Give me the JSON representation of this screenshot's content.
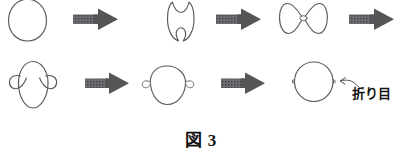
{
  "figure": {
    "caption_label": "図",
    "caption_number": "3",
    "annotation_label": "折り目",
    "annotation_meaning_icon": "pointer-arrow-icon",
    "stroke_color": "#5a5a5e",
    "arrow_color": "#555558",
    "background_color": "#ffffff",
    "rows": [
      {
        "row_name": "top-row",
        "steps": [
          {
            "name": "shape-circle-plain",
            "icon": "circle-curve-icon",
            "order": 1
          },
          {
            "name": "transition-arrow-1",
            "icon": "right-arrow-icon",
            "order": 2
          },
          {
            "name": "shape-pinched-circle",
            "icon": "pinched-circle-curve-icon",
            "order": 3
          },
          {
            "name": "transition-arrow-2",
            "icon": "right-arrow-icon",
            "order": 4
          },
          {
            "name": "shape-figure-eight",
            "icon": "figure-eight-curve-icon",
            "order": 5
          },
          {
            "name": "transition-arrow-3",
            "icon": "right-arrow-icon",
            "order": 6
          }
        ]
      },
      {
        "row_name": "bottom-row",
        "steps": [
          {
            "name": "shape-oval-two-side-loops",
            "icon": "oval-side-loops-curve-icon",
            "order": 7
          },
          {
            "name": "transition-arrow-4",
            "icon": "right-arrow-icon",
            "order": 8
          },
          {
            "name": "shape-round-small-loops",
            "icon": "round-small-loops-curve-icon",
            "order": 9
          },
          {
            "name": "transition-arrow-5",
            "icon": "right-arrow-icon",
            "order": 10
          },
          {
            "name": "shape-final-circle-with-folds",
            "icon": "circle-with-fold-marks-icon",
            "order": 11
          }
        ]
      }
    ]
  }
}
